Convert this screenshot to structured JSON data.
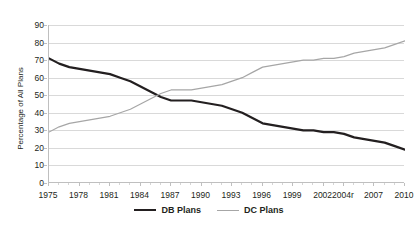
{
  "chart_data": {
    "type": "line",
    "title": "",
    "xlabel": "",
    "ylabel": "Percentage of All Plans",
    "ylim": [
      0,
      90
    ],
    "ytick_step": 10,
    "yticks": [
      90,
      80,
      70,
      60,
      50,
      40,
      30,
      20,
      10,
      0
    ],
    "grid": true,
    "legend_position": "bottom",
    "x": [
      1975,
      1976,
      1977,
      1978,
      1979,
      1980,
      1981,
      1982,
      1983,
      1984,
      1985,
      1986,
      1987,
      1988,
      1989,
      1990,
      1991,
      1992,
      1993,
      1994,
      1995,
      1996,
      1997,
      1998,
      1999,
      2000,
      2001,
      2002,
      2003,
      2004,
      2005,
      2006,
      2007,
      2008,
      2009,
      2010
    ],
    "xtick_labels": [
      "1975",
      "1978",
      "1981",
      "1984",
      "1987",
      "1990",
      "1993",
      "1996",
      "1999",
      "2002",
      "2004r",
      "2007",
      "2010"
    ],
    "xtick_values": [
      1975,
      1978,
      1981,
      1984,
      1987,
      1990,
      1993,
      1996,
      1999,
      2002,
      2004,
      2007,
      2010
    ],
    "series": [
      {
        "name": "DB Plans",
        "color": "#231f20",
        "width": 2.2,
        "values": [
          71,
          68,
          66,
          65,
          64,
          63,
          62,
          60,
          58,
          55,
          52,
          49,
          47,
          47,
          47,
          46,
          45,
          44,
          42,
          40,
          37,
          34,
          33,
          32,
          31,
          30,
          30,
          29,
          29,
          28,
          26,
          25,
          24,
          23,
          21,
          19
        ]
      },
      {
        "name": "DC Plans",
        "color": "#a6a6a6",
        "width": 1.2,
        "values": [
          29,
          32,
          34,
          35,
          36,
          37,
          38,
          40,
          42,
          45,
          48,
          51,
          53,
          53,
          53,
          54,
          55,
          56,
          58,
          60,
          63,
          66,
          67,
          68,
          69,
          70,
          70,
          71,
          71,
          72,
          74,
          75,
          76,
          77,
          79,
          81
        ]
      }
    ]
  },
  "legend": {
    "items": [
      {
        "label": "DB Plans",
        "style": "db"
      },
      {
        "label": "DC Plans",
        "style": "dc"
      }
    ]
  },
  "colors": {
    "db_line": "#231f20",
    "dc_line": "#a6a6a6",
    "gridline": "#d9d9d9",
    "axis": "#bfbfbf",
    "text": "#231f20",
    "background": "#ffffff"
  }
}
